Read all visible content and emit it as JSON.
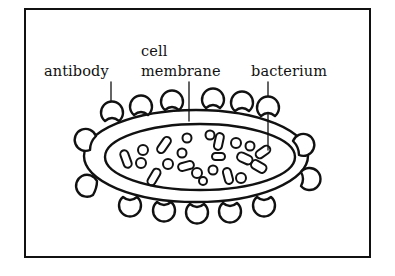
{
  "figure": {
    "type": "labeled biology diagram",
    "labels": {
      "antibody": "antibody",
      "cell_line1": "cell",
      "cell_line2": "membrane",
      "bacterium": "bacterium"
    },
    "colors": {
      "stroke": "#111111",
      "background": "#ffffff"
    }
  }
}
